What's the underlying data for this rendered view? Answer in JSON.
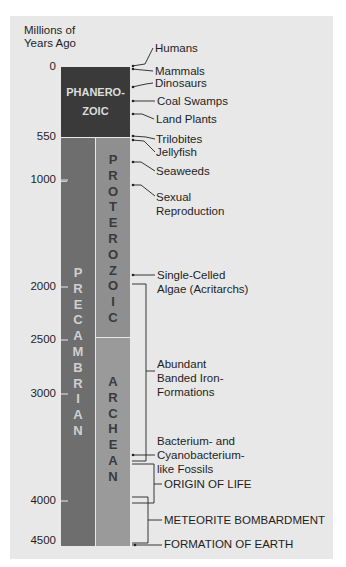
{
  "axis": {
    "title_line1": "Millions of",
    "title_line2": "Years Ago",
    "ticks": [
      "0",
      "550",
      "1000",
      "2000",
      "2500",
      "3000",
      "4000",
      "4500"
    ]
  },
  "eons": {
    "phanerozoic_line1": "PHANERO-",
    "phanerozoic_line2": "ZOIC",
    "precambrian": [
      "P",
      "R",
      "E",
      "C",
      "A",
      "M",
      "B",
      "R",
      "I",
      "A",
      "N"
    ],
    "proterozoic": [
      "P",
      "R",
      "O",
      "T",
      "E",
      "R",
      "O",
      "Z",
      "O",
      "I",
      "C"
    ],
    "archean": [
      "A",
      "R",
      "C",
      "H",
      "E",
      "A",
      "N"
    ]
  },
  "events": {
    "humans": "Humans",
    "mammals": "Mammals",
    "dinosaurs": "Dinosaurs",
    "coal_swamps": "Coal Swamps",
    "land_plants": "Land Plants",
    "trilobites": "Trilobites",
    "jellyfish": "Jellyfish",
    "seaweeds": "Seaweeds",
    "sexual_1": "Sexual",
    "sexual_2": "Reproduction",
    "algae_1": "Single-Celled",
    "algae_2": "Algae (Acritarchs)",
    "iron_1": "Abundant",
    "iron_2": "Banded Iron-",
    "iron_3": "Formations",
    "bact_1": "Bacterium- and",
    "bact_2": "Cyanobacterium-",
    "bact_3": "like Fossils",
    "origin": "ORIGIN OF LIFE",
    "meteorite": "METEORITE BOMBARDMENT",
    "formation": "FORMATION OF EARTH"
  },
  "colors": {
    "phanerozoic": "#3a3a3a",
    "precambrian": "#6e6e6e",
    "proterozoic": "#8f8f8f",
    "archean": "#9a9a9a",
    "panel": "#e8e8e8"
  }
}
